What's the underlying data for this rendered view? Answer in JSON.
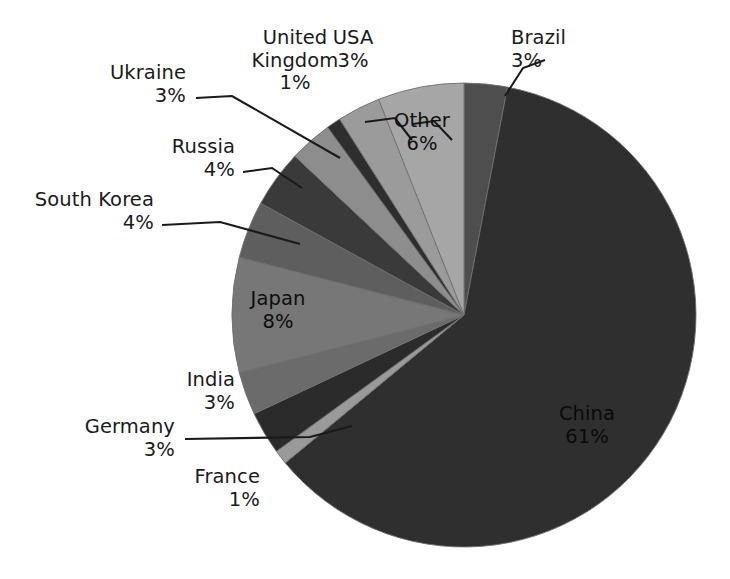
{
  "chart_data": {
    "type": "pie",
    "title": "",
    "categories": [
      "Brazil",
      "China",
      "France",
      "Germany",
      "India",
      "Japan",
      "South Korea",
      "Russia",
      "Ukraine",
      "United Kingdom",
      "USA",
      "Other"
    ],
    "values": [
      3,
      61,
      1,
      3,
      3,
      8,
      4,
      4,
      3,
      1,
      3,
      6
    ],
    "unit": "%",
    "legend": "none",
    "start_angle_deg": 0,
    "direction": "clockwise",
    "slices": [
      {
        "label": "Brazil",
        "value": 3,
        "pct_text": "3%",
        "color": "#4e4e4e",
        "placement": "callout"
      },
      {
        "label": "China",
        "value": 61,
        "pct_text": "61%",
        "color": "#2f2f2f",
        "placement": "inside"
      },
      {
        "label": "France",
        "value": 1,
        "pct_text": "1%",
        "color": "#9a9a9a",
        "placement": "callout"
      },
      {
        "label": "Germany",
        "value": 3,
        "pct_text": "3%",
        "color": "#2b2b2b",
        "placement": "callout"
      },
      {
        "label": "India",
        "value": 3,
        "pct_text": "3%",
        "color": "#6b6b6b",
        "placement": "callout"
      },
      {
        "label": "Japan",
        "value": 8,
        "pct_text": "8%",
        "color": "#777777",
        "placement": "inside"
      },
      {
        "label": "South Korea",
        "value": 4,
        "pct_text": "4%",
        "color": "#5e5e5e",
        "placement": "callout"
      },
      {
        "label": "Russia",
        "value": 4,
        "pct_text": "4%",
        "color": "#3a3a3a",
        "placement": "callout"
      },
      {
        "label": "Ukraine",
        "value": 3,
        "pct_text": "3%",
        "color": "#8d8d8d",
        "placement": "callout"
      },
      {
        "label": "United Kingdom",
        "value": 1,
        "pct_text": "1%",
        "color": "#2e2e2e",
        "placement": "callout"
      },
      {
        "label": "USA",
        "value": 3,
        "pct_text": "3%",
        "color": "#9b9b9b",
        "placement": "callout"
      },
      {
        "label": "Other",
        "value": 6,
        "pct_text": "6%",
        "color": "#a6a6a6",
        "placement": "inside"
      }
    ]
  },
  "labels": {
    "ukraine": {
      "name": "Ukraine",
      "pct": "3%"
    },
    "united_kingdom": {
      "name": "United Kingdom",
      "pct": "1%"
    },
    "usa": {
      "name": "USA",
      "pct": "3%"
    },
    "brazil": {
      "name": "Brazil",
      "pct": "3%"
    },
    "russia": {
      "name": "Russia",
      "pct": "4%"
    },
    "south_korea": {
      "name": "South Korea",
      "pct": "4%"
    },
    "india": {
      "name": "India",
      "pct": "3%"
    },
    "germany": {
      "name": "Germany",
      "pct": "3%"
    },
    "france": {
      "name": "France",
      "pct": "1%"
    },
    "other": {
      "name": "Other",
      "pct": "6%"
    },
    "japan": {
      "name": "Japan",
      "pct": "8%"
    },
    "china": {
      "name": "China",
      "pct": "61%"
    }
  },
  "style": {
    "background": "#ffffff",
    "text_color": "#1a1a1a",
    "leader_line_color": "#1a1a1a",
    "slice_edge_color": "#6f6f6f"
  },
  "geometry": {
    "center_x": 464,
    "center_y": 315,
    "radius": 232
  }
}
